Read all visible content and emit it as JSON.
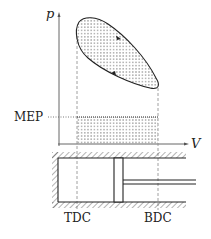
{
  "diagram": {
    "axes": {
      "y_label": "p",
      "x_label": "V"
    },
    "labels": {
      "mep": "MEP",
      "tdc": "TDC",
      "bdc": "BDC"
    },
    "colors": {
      "stroke": "#222222",
      "dashed": "#888888",
      "dots": "#333333"
    }
  }
}
